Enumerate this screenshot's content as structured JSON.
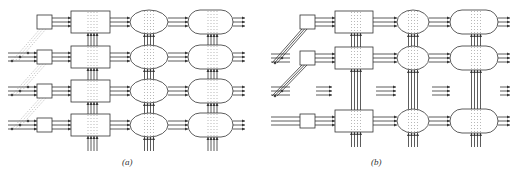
{
  "figure": {
    "panels": [
      {
        "id": "a",
        "label": "(a)",
        "label_pos": [
          128,
          165
        ],
        "rows_y": [
          22,
          57,
          91,
          125
        ],
        "stages": [
          "small-box",
          "rect",
          "ellipse",
          "stadium"
        ],
        "input_connection": "dotted-diagonal"
      },
      {
        "id": "b",
        "label": "(b)",
        "label_pos": [
          377,
          165
        ],
        "rows_y": [
          22,
          58,
          121
        ],
        "gap_row_y": 91,
        "stages": [
          "small-box",
          "rect",
          "ellipse",
          "stadium"
        ],
        "input_connection": "solid-diagonal"
      }
    ]
  },
  "colors": {
    "stroke": "#333333",
    "dots": "#888888",
    "background": "#ffffff"
  }
}
